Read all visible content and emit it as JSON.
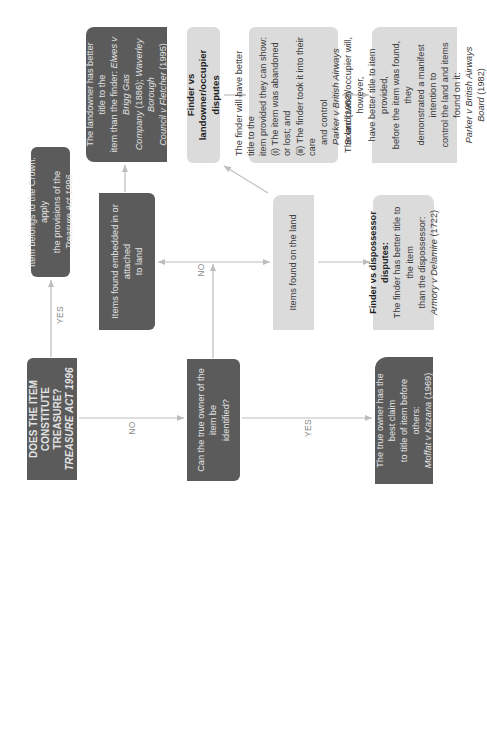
{
  "diagram": {
    "colors": {
      "dark_box": "#5b5b5b",
      "dark_text": "#e2e2e2",
      "light_box": "#dbdbdb",
      "light_text": "#3a3a3a",
      "arrow": "#bdbdbd",
      "label": "#8a8a8a"
    },
    "orientation": "rotated 90 degrees counter-clockwise",
    "nodes": {
      "treasure": {
        "line1": "DOES THE ITEM CONSTITUTE",
        "line2": "TREASURE?",
        "line3": "TREASURE ACT 1996"
      },
      "crown": {
        "line1": "Item belongs to the Crown: apply",
        "line2_pre": "the provisions of the ",
        "line2_italic": "Treasure Act 1996"
      },
      "owner_question": {
        "line1": "Can the true owner of the item be",
        "line2": "identified?"
      },
      "true_owner": {
        "line1": "The true owner has the best claim",
        "line2": "to title of item before others:",
        "line3_italic": "Moffat v Kazana",
        "line3_post": " (1969)"
      },
      "embedded": {
        "line1": "Items found embedded in or attached",
        "line2": "to land"
      },
      "landowner": {
        "line1": "The landowner has better title to the",
        "line2_pre": "item than the finder: ",
        "line2_italic": "Elwes v Brigg Gas",
        "line3_pre": "Company",
        "line3_post": " (1886); ",
        "line3_italic": "Waverley Borough",
        "line4_italic": "Council v Fletcher",
        "line4_post": " (1995)"
      },
      "on_land": {
        "line1": "Items found on the land"
      },
      "finder_vs_landowner": {
        "heading": "Finder vs landowner/occupier disputes"
      },
      "finder_title": {
        "line1": "The finder will have better title to the",
        "line2": "item provided they can show:",
        "line3": "(i)  The item was abandoned or lost; and",
        "line4": "(ii) The finder took it into their care",
        "line5": "and control",
        "line6_italic": "Parker v British Airways Board",
        "line6_post": " (1982)"
      },
      "occupier": {
        "line1": "The landowner/occupier will, however,",
        "line2": "have better title to item provided,",
        "line3": "before the item was found, they",
        "line4": "demonstrated a manifest intention to",
        "line5": "control the land and items found on it:",
        "line6_italic": "Parker v British Airways Board",
        "line6_post": " (1982)"
      },
      "finder_vs_dispossessor": {
        "heading": "Finder vs dispossessor disputes:",
        "line1": "The finder has better title to the item",
        "line2": "than the dispossessor:",
        "line3_italic": "Armory v Delamire",
        "line3_post": " (1722)"
      }
    },
    "edge_labels": {
      "treasure_yes": "YES",
      "treasure_no": "NO",
      "owner_yes": "YES",
      "owner_no": "NO"
    }
  }
}
